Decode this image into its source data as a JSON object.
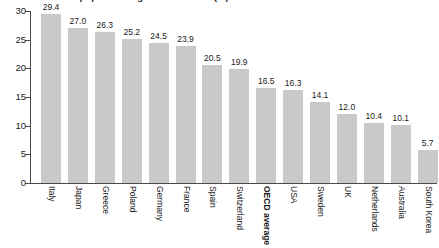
{
  "chart_data": {
    "type": "bar",
    "title": "Share of population aged 65 and over (%)",
    "xlabel": "",
    "ylabel": "",
    "ylim": [
      0,
      30
    ],
    "ytick_labels": [
      "0",
      "5",
      "10",
      "15",
      "20",
      "25",
      "30"
    ],
    "ytick_values": [
      0,
      5,
      10,
      15,
      20,
      25,
      30
    ],
    "grid": false,
    "legend": "none",
    "bar_color": "#c9c9c9",
    "axis_color": "#4a4a4a",
    "categories": [
      "Italy",
      "Japan",
      "Greece",
      "Poland",
      "Germany",
      "France",
      "Spain",
      "Switzerland",
      "OECD average",
      "USA",
      "Sweden",
      "UK",
      "Netherlands",
      "Australia",
      "South Korea"
    ],
    "values": [
      29.4,
      27.0,
      26.3,
      25.2,
      24.5,
      23.9,
      20.5,
      19.9,
      16.5,
      16.3,
      14.1,
      12.0,
      10.4,
      10.1,
      5.7
    ],
    "value_labels": [
      "29.4",
      "27.0",
      "26.3",
      "25.2",
      "24.5",
      "23.9",
      "20.5",
      "19.9",
      "16.5",
      "16.3",
      "14.1",
      "12.0",
      "10.4",
      "10.1",
      "5.7"
    ],
    "highlighted_categories": [
      "OECD average"
    ]
  }
}
